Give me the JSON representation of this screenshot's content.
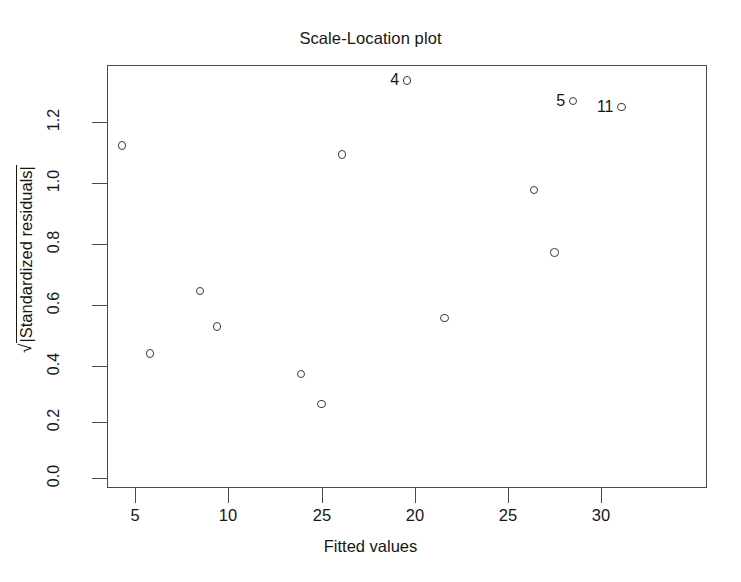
{
  "chart_data": {
    "type": "scatter",
    "title": "Scale-Location plot",
    "xlabel": "Fitted values",
    "ylabel": "√|Standardized residuals|",
    "xlim": [
      0.0,
      32.26
    ],
    "ylim": [
      0.0,
      1.421
    ],
    "grid": false,
    "legend": false,
    "x_tick_labels": [
      "5",
      "10",
      "25",
      "20",
      "25",
      "30"
    ],
    "x_tick_values": [
      5,
      10,
      15,
      20,
      25,
      30
    ],
    "y_tick_labels": [
      "0.0",
      "0.2",
      "0.4",
      "0.6",
      "0.8",
      "1.0",
      "1.2"
    ],
    "y_tick_values": [
      0.0,
      0.2,
      0.4,
      0.6,
      0.8,
      1.0,
      1.2
    ],
    "marker": "open-circle",
    "marker_color": "#3c3c3c",
    "points": [
      {
        "x": 4.3,
        "y": 1.12,
        "label": null
      },
      {
        "x": 5.8,
        "y": 0.42,
        "label": null
      },
      {
        "x": 8.5,
        "y": 0.63,
        "label": null
      },
      {
        "x": 9.4,
        "y": 0.51,
        "label": null
      },
      {
        "x": 13.9,
        "y": 0.35,
        "label": null
      },
      {
        "x": 15.0,
        "y": 0.25,
        "label": null
      },
      {
        "x": 16.1,
        "y": 1.09,
        "label": null
      },
      {
        "x": 19.6,
        "y": 1.34,
        "label": "4"
      },
      {
        "x": 21.6,
        "y": 0.54,
        "label": null
      },
      {
        "x": 26.4,
        "y": 0.97,
        "label": null
      },
      {
        "x": 27.5,
        "y": 0.76,
        "label": null
      },
      {
        "x": 28.5,
        "y": 1.27,
        "label": "5"
      },
      {
        "x": 31.1,
        "y": 1.25,
        "label": "11"
      }
    ],
    "labeled_outliers": [
      "4",
      "5",
      "11"
    ]
  },
  "axes": {
    "title": "Scale-Location plot",
    "x_title": "Fitted values",
    "y_title_radical": "√",
    "y_title_radicand": "|Standardized residuals|",
    "y_ticks": [
      {
        "label": "1.2",
        "pos": 122
      },
      {
        "label": "1.0",
        "pos": 183
      },
      {
        "label": "0.8",
        "pos": 244
      },
      {
        "label": "0.6",
        "pos": 305
      },
      {
        "label": "0.4",
        "pos": 366
      },
      {
        "label": "0.2",
        "pos": 422
      },
      {
        "label": "0.0",
        "pos": 478
      }
    ],
    "x_ticks": [
      {
        "label": "5",
        "pos": 135
      },
      {
        "label": "10",
        "pos": 228
      },
      {
        "label": "25",
        "pos": 322
      },
      {
        "label": "20",
        "pos": 415
      },
      {
        "label": "25",
        "pos": 508
      },
      {
        "label": "30",
        "pos": 601
      }
    ]
  },
  "style": {
    "background": "#ffffff",
    "frame_color": "#4a4a4a",
    "text_color": "#161616",
    "marker_color": "#3c3c3c"
  }
}
